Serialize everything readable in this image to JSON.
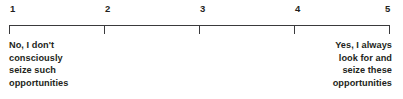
{
  "widget": {
    "type": "likert-scale",
    "title": "5-point rating scale",
    "background_color": "#ffffff",
    "line_color": "#3a3a3c",
    "text_color": "#231f20"
  },
  "scale": {
    "min": 1,
    "max": 5,
    "ticks": [
      {
        "value": "1",
        "label": "1",
        "position_pct": 0
      },
      {
        "value": "2",
        "label": "2",
        "position_pct": 25
      },
      {
        "value": "3",
        "label": "3",
        "position_pct": 50
      },
      {
        "value": "4",
        "label": "4",
        "position_pct": 75
      },
      {
        "value": "5",
        "label": "5",
        "position_pct": 100
      }
    ]
  },
  "anchors": {
    "low": {
      "full_text": "No, I don't consciously seize such opportunities",
      "lines": [
        "No, I don't",
        "consciously",
        "seize such",
        "opportunities"
      ]
    },
    "high": {
      "full_text": "Yes, I always look for and seize these opportunities",
      "lines": [
        "Yes, I always",
        "look for and",
        "seize these",
        "opportunities"
      ]
    }
  }
}
